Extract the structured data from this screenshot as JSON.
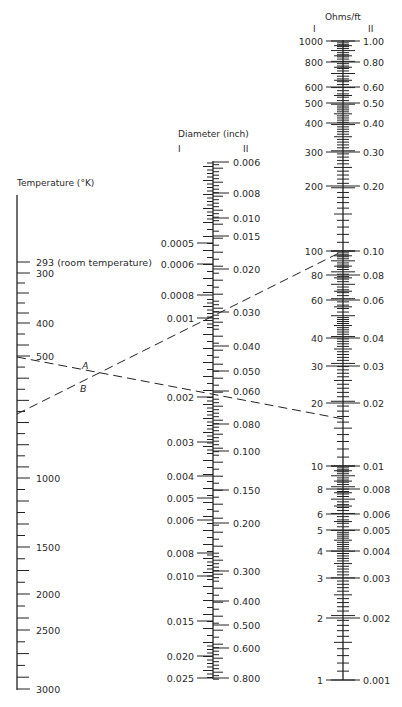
{
  "temperature_scale": {
    "title": "Temperature (°K)",
    "labels": [
      {
        "value": "293 (room temperature)",
        "y": 262
      },
      {
        "value": "300",
        "y": 273
      },
      {
        "value": "400",
        "y": 323
      },
      {
        "value": "500",
        "y": 356
      },
      {
        "value": "1000",
        "y": 478
      },
      {
        "value": "1500",
        "y": 547
      },
      {
        "value": "2000",
        "y": 594
      },
      {
        "value": "2500",
        "y": 630
      },
      {
        "value": "3000",
        "y": 689
      }
    ]
  },
  "diameter_scale": {
    "title": "Diameter (inch)",
    "col_I_header": "I",
    "col_II_header": "II",
    "col_I_labels": [
      {
        "value": "0.0005",
        "y": 243
      },
      {
        "value": "0.0006",
        "y": 264
      },
      {
        "value": "0.0008",
        "y": 295
      },
      {
        "value": "0.001",
        "y": 318
      },
      {
        "value": "0.002",
        "y": 397
      },
      {
        "value": "0.003",
        "y": 442
      },
      {
        "value": "0.004",
        "y": 476
      },
      {
        "value": "0.005",
        "y": 498
      },
      {
        "value": "0.006",
        "y": 520
      },
      {
        "value": "0.008",
        "y": 553
      },
      {
        "value": "0.010",
        "y": 576
      },
      {
        "value": "0.015",
        "y": 621
      },
      {
        "value": "0.020",
        "y": 656
      },
      {
        "value": "0.025",
        "y": 678
      }
    ],
    "col_II_labels": [
      {
        "value": "0.006",
        "y": 162
      },
      {
        "value": "0.008",
        "y": 193
      },
      {
        "value": "0.010",
        "y": 218
      },
      {
        "value": "0.015",
        "y": 236
      },
      {
        "value": "0.020",
        "y": 269
      },
      {
        "value": "0.030",
        "y": 312
      },
      {
        "value": "0.040",
        "y": 346
      },
      {
        "value": "0.050",
        "y": 371
      },
      {
        "value": "0.060",
        "y": 391
      },
      {
        "value": "0.080",
        "y": 424
      },
      {
        "value": "0.100",
        "y": 451
      },
      {
        "value": "0.150",
        "y": 490
      },
      {
        "value": "0.200",
        "y": 523
      },
      {
        "value": "0.300",
        "y": 571
      },
      {
        "value": "0.400",
        "y": 601
      },
      {
        "value": "0.500",
        "y": 625
      },
      {
        "value": "0.600",
        "y": 648
      },
      {
        "value": "0.800",
        "y": 678
      }
    ]
  },
  "resistance_scale": {
    "title": "Ohms/ft",
    "col_I_header": "I",
    "col_II_header": "II",
    "col_I_labels": [
      {
        "value": "1000",
        "y": 41
      },
      {
        "value": "800",
        "y": 62
      },
      {
        "value": "600",
        "y": 87
      },
      {
        "value": "500",
        "y": 103
      },
      {
        "value": "400",
        "y": 123
      },
      {
        "value": "300",
        "y": 152
      },
      {
        "value": "200",
        "y": 186
      },
      {
        "value": "100",
        "y": 251
      },
      {
        "value": "80",
        "y": 275
      },
      {
        "value": "60",
        "y": 300
      },
      {
        "value": "40",
        "y": 338
      },
      {
        "value": "30",
        "y": 366
      },
      {
        "value": "20",
        "y": 403
      },
      {
        "value": "10",
        "y": 466
      },
      {
        "value": "8",
        "y": 489
      },
      {
        "value": "6",
        "y": 514
      },
      {
        "value": "5",
        "y": 530
      },
      {
        "value": "4",
        "y": 551
      },
      {
        "value": "3",
        "y": 578
      },
      {
        "value": "2",
        "y": 618
      },
      {
        "value": "1",
        "y": 680
      }
    ],
    "col_II_labels": [
      {
        "value": "1.00",
        "y": 41
      },
      {
        "value": "0.80",
        "y": 62
      },
      {
        "value": "0.60",
        "y": 87
      },
      {
        "value": "0.50",
        "y": 103
      },
      {
        "value": "0.40",
        "y": 123
      },
      {
        "value": "0.30",
        "y": 152
      },
      {
        "value": "0.20",
        "y": 186
      },
      {
        "value": "0.10",
        "y": 251
      },
      {
        "value": "0.08",
        "y": 275
      },
      {
        "value": "0.06",
        "y": 300
      },
      {
        "value": "0.04",
        "y": 338
      },
      {
        "value": "0.03",
        "y": 366
      },
      {
        "value": "0.02",
        "y": 403
      },
      {
        "value": "0.01",
        "y": 466
      },
      {
        "value": "0.008",
        "y": 489
      },
      {
        "value": "0.006",
        "y": 514
      },
      {
        "value": "0.005",
        "y": 530
      },
      {
        "value": "0.004",
        "y": 551
      },
      {
        "value": "0.003",
        "y": 578
      },
      {
        "value": "0.002",
        "y": 618
      },
      {
        "value": "0.001",
        "y": 680
      }
    ]
  },
  "example_lines": [
    {
      "label": "A",
      "from": {
        "x": 17,
        "y": 357
      },
      "to": {
        "x": 343,
        "y": 419
      },
      "label_pos": {
        "x": 82,
        "y": 369
      }
    },
    {
      "label": "B",
      "from": {
        "x": 17,
        "y": 414
      },
      "to": {
        "x": 343,
        "y": 251
      },
      "label_pos": {
        "x": 80,
        "y": 392
      }
    }
  ]
}
